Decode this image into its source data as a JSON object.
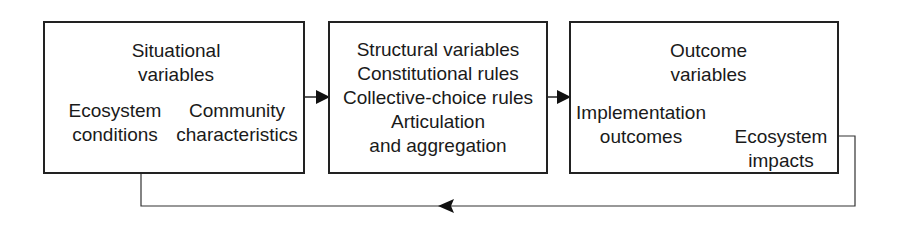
{
  "diagram": {
    "boxes": [
      {
        "id": "situational",
        "title": [
          "Situational",
          "variables"
        ],
        "sub_left": [
          "Ecosystem",
          "conditions"
        ],
        "sub_right": [
          "Community",
          "characteristics"
        ]
      },
      {
        "id": "structural",
        "lines": [
          "Structural variables",
          "Constitutional rules",
          "Collective-choice rules",
          "Articulation",
          "and aggregation"
        ]
      },
      {
        "id": "outcome",
        "title": [
          "Outcome",
          "variables"
        ],
        "sub_left": [
          "Implementation",
          "outcomes"
        ],
        "sub_right": [
          "Ecosystem",
          "impacts"
        ]
      }
    ],
    "edges": [
      {
        "from": "situational",
        "to": "structural",
        "type": "arrow"
      },
      {
        "from": "structural",
        "to": "outcome",
        "type": "arrow"
      },
      {
        "from": "outcome",
        "to": "situational",
        "type": "feedback-arrow"
      }
    ],
    "colors": {
      "line": "#222222",
      "background": "#ffffff"
    }
  }
}
